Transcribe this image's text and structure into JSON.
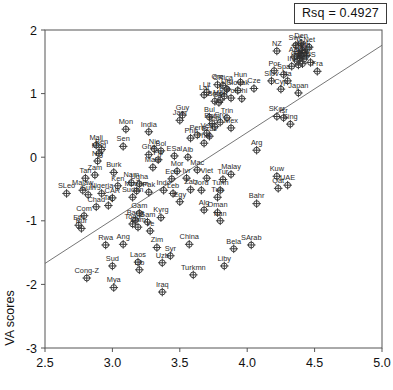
{
  "annotation": {
    "rsq_label": "Rsq = 0.4927"
  },
  "chart_data": {
    "type": "scatter",
    "title": "",
    "xlabel": "",
    "ylabel": "VA scores",
    "xlim": [
      2.5,
      5.0
    ],
    "ylim": [
      -3,
      2
    ],
    "xticks": [
      "2.5",
      "3.0",
      "3.5",
      "4.0",
      "4.5",
      "5.0"
    ],
    "xtick_values": [
      2.5,
      3.0,
      3.5,
      4.0,
      4.5,
      5.0
    ],
    "yticks": [
      "2",
      "1",
      "0",
      "-1",
      "-2",
      "-3"
    ],
    "ytick_values": [
      2,
      1,
      0,
      -1,
      -2,
      -3
    ],
    "grid": false,
    "legend": "none",
    "marker": "circle-with-cross",
    "rsq": 0.4927,
    "trendline": {
      "type": "linear",
      "x0": 2.5,
      "y0": -1.67,
      "x1": 5.0,
      "y1": 1.76
    },
    "points": [
      {
        "label": "Den",
        "x": 4.4,
        "y": 1.79
      },
      {
        "label": "Swe",
        "x": 4.36,
        "y": 1.76
      },
      {
        "label": "Net",
        "x": 4.46,
        "y": 1.73
      },
      {
        "label": "NZ",
        "x": 4.22,
        "y": 1.67
      },
      {
        "label": "Nor",
        "x": 4.41,
        "y": 1.68
      },
      {
        "label": "Fin",
        "x": 4.43,
        "y": 1.65
      },
      {
        "label": "Swi",
        "x": 4.38,
        "y": 1.63
      },
      {
        "label": "Can",
        "x": 4.4,
        "y": 1.62
      },
      {
        "label": "Lux",
        "x": 4.44,
        "y": 1.6
      },
      {
        "label": "Aut",
        "x": 4.35,
        "y": 1.58
      },
      {
        "label": "Aus",
        "x": 4.39,
        "y": 1.56
      },
      {
        "label": "Ice",
        "x": 4.42,
        "y": 1.54
      },
      {
        "label": "Ger",
        "x": 4.37,
        "y": 1.51
      },
      {
        "label": "US",
        "x": 4.47,
        "y": 1.49
      },
      {
        "label": "Bel",
        "x": 4.41,
        "y": 1.47
      },
      {
        "label": "UK",
        "x": 4.38,
        "y": 1.45
      },
      {
        "label": "Ire",
        "x": 4.33,
        "y": 1.43
      },
      {
        "label": "Fra",
        "x": 4.52,
        "y": 1.35
      },
      {
        "label": "Por",
        "x": 4.2,
        "y": 1.36
      },
      {
        "label": "Spa",
        "x": 4.27,
        "y": 1.3
      },
      {
        "label": "Hun",
        "x": 3.95,
        "y": 1.18
      },
      {
        "label": "Slov",
        "x": 4.18,
        "y": 1.2
      },
      {
        "label": "Ita",
        "x": 4.3,
        "y": 1.2
      },
      {
        "label": "Gre",
        "x": 3.78,
        "y": 1.14
      },
      {
        "label": "CRica",
        "x": 3.82,
        "y": 1.13
      },
      {
        "label": "Cze",
        "x": 4.05,
        "y": 1.08
      },
      {
        "label": "Cyp",
        "x": 4.25,
        "y": 1.07
      },
      {
        "label": "Japan",
        "x": 4.38,
        "y": 1.01
      },
      {
        "label": "Slovak",
        "x": 3.93,
        "y": 1.05
      },
      {
        "label": "Uru",
        "x": 3.85,
        "y": 1.07
      },
      {
        "label": "Lit",
        "x": 3.7,
        "y": 1.02
      },
      {
        "label": "Lat",
        "x": 3.68,
        "y": 0.98
      },
      {
        "label": "Est",
        "x": 3.83,
        "y": 0.96
      },
      {
        "label": "Pol",
        "x": 3.88,
        "y": 0.93
      },
      {
        "label": "Chi",
        "x": 3.96,
        "y": 0.92
      },
      {
        "label": "Mau",
        "x": 3.8,
        "y": 0.9
      },
      {
        "label": "Bots",
        "x": 3.76,
        "y": 0.88
      },
      {
        "label": "SAf",
        "x": 3.79,
        "y": 0.86
      },
      {
        "label": "Guy",
        "x": 3.52,
        "y": 0.66
      },
      {
        "label": "Jam",
        "x": 3.5,
        "y": 0.58
      },
      {
        "label": "Bul",
        "x": 3.72,
        "y": 0.63
      },
      {
        "label": "Trin",
        "x": 3.85,
        "y": 0.62
      },
      {
        "label": "SKor",
        "x": 4.22,
        "y": 0.64
      },
      {
        "label": "Isr",
        "x": 4.27,
        "y": 0.62
      },
      {
        "label": "Sing",
        "x": 4.32,
        "y": 0.52
      },
      {
        "label": "Rom",
        "x": 3.74,
        "y": 0.53
      },
      {
        "label": "Cro",
        "x": 3.8,
        "y": 0.55
      },
      {
        "label": "Pan",
        "x": 3.76,
        "y": 0.48
      },
      {
        "label": "Mex",
        "x": 3.88,
        "y": 0.46
      },
      {
        "label": "Mon",
        "x": 3.1,
        "y": 0.44
      },
      {
        "label": "India",
        "x": 3.27,
        "y": 0.4
      },
      {
        "label": "Ven",
        "x": 3.7,
        "y": 0.38
      },
      {
        "label": "Peru",
        "x": 3.63,
        "y": 0.35
      },
      {
        "label": "Braz",
        "x": 3.72,
        "y": 0.33
      },
      {
        "label": "Phil",
        "x": 3.58,
        "y": 0.3
      },
      {
        "label": "Sen",
        "x": 3.08,
        "y": 0.17
      },
      {
        "label": "Mali",
        "x": 2.88,
        "y": 0.19
      },
      {
        "label": "Ben",
        "x": 2.92,
        "y": 0.12
      },
      {
        "label": "Mad",
        "x": 2.9,
        "y": 0.06
      },
      {
        "label": "Nic",
        "x": 3.31,
        "y": 0.13
      },
      {
        "label": "Bol",
        "x": 3.36,
        "y": 0.1
      },
      {
        "label": "Gha",
        "x": 3.27,
        "y": 0.04
      },
      {
        "label": "Arg",
        "x": 4.07,
        "y": 0.11
      },
      {
        "label": "Thai",
        "x": 3.68,
        "y": 0.22
      },
      {
        "label": "ESal",
        "x": 3.46,
        "y": 0.02
      },
      {
        "label": "Alb",
        "x": 3.56,
        "y": 0.0
      },
      {
        "label": "Nig",
        "x": 2.89,
        "y": -0.06
      },
      {
        "label": "Fiji",
        "x": 3.34,
        "y": -0.04
      },
      {
        "label": "Burk",
        "x": 3.01,
        "y": -0.24
      },
      {
        "label": "Mala",
        "x": 3.3,
        "y": -0.16
      },
      {
        "label": "Mor",
        "x": 3.48,
        "y": -0.22
      },
      {
        "label": "Mac",
        "x": 3.63,
        "y": -0.2
      },
      {
        "label": "Malay",
        "x": 3.88,
        "y": -0.27
      },
      {
        "label": "Kuw",
        "x": 4.22,
        "y": -0.3
      },
      {
        "label": "Tan",
        "x": 2.8,
        "y": -0.33
      },
      {
        "label": "Zam",
        "x": 2.87,
        "y": -0.28
      },
      {
        "label": "Nam",
        "x": 3.14,
        "y": -0.4
      },
      {
        "label": "Ugha",
        "x": 3.2,
        "y": -0.42
      },
      {
        "label": "Ecu",
        "x": 3.44,
        "y": -0.34
      },
      {
        "label": "Ivr",
        "x": 3.55,
        "y": -0.33
      },
      {
        "label": "Ken",
        "x": 3.04,
        "y": -0.45
      },
      {
        "label": "Viet",
        "x": 3.7,
        "y": -0.33
      },
      {
        "label": "Tur",
        "x": 3.82,
        "y": -0.35
      },
      {
        "label": "SLeo",
        "x": 2.66,
        "y": -0.57
      },
      {
        "label": "Malaw",
        "x": 2.78,
        "y": -0.52
      },
      {
        "label": "Guin",
        "x": 2.82,
        "y": -0.59
      },
      {
        "label": "Nigeria",
        "x": 2.92,
        "y": -0.57
      },
      {
        "label": "Mozam",
        "x": 3.18,
        "y": -0.53
      },
      {
        "label": "Pak",
        "x": 3.27,
        "y": -0.55
      },
      {
        "label": "Indo",
        "x": 3.38,
        "y": -0.52
      },
      {
        "label": "Leb",
        "x": 3.45,
        "y": -0.57
      },
      {
        "label": "Qat",
        "x": 4.23,
        "y": -0.49
      },
      {
        "label": "UAE",
        "x": 4.3,
        "y": -0.44
      },
      {
        "label": "Zab",
        "x": 3.58,
        "y": -0.51
      },
      {
        "label": "Jord",
        "x": 3.66,
        "y": -0.52
      },
      {
        "label": "Tunh",
        "x": 3.8,
        "y": -0.52
      },
      {
        "label": "CAR",
        "x": 3.0,
        "y": -0.64
      },
      {
        "label": "Sudan",
        "x": 3.15,
        "y": -0.63
      },
      {
        "label": "Tun",
        "x": 3.78,
        "y": -0.63
      },
      {
        "label": "Bahr",
        "x": 4.07,
        "y": -0.73
      },
      {
        "label": "Egy",
        "x": 3.5,
        "y": -0.7
      },
      {
        "label": "Chad",
        "x": 2.88,
        "y": -0.78
      },
      {
        "label": "Taj",
        "x": 2.97,
        "y": -0.76
      },
      {
        "label": "Alg",
        "x": 3.68,
        "y": -0.83
      },
      {
        "label": "Oman",
        "x": 3.78,
        "y": -0.87
      },
      {
        "label": "Com",
        "x": 2.79,
        "y": -0.92
      },
      {
        "label": "Gam",
        "x": 3.2,
        "y": -0.88
      },
      {
        "label": "Kyrg",
        "x": 3.36,
        "y": -0.95
      },
      {
        "label": "Iran",
        "x": 3.8,
        "y": -1.0
      },
      {
        "label": "Bang",
        "x": 3.17,
        "y": -0.99
      },
      {
        "label": "Eth",
        "x": 2.75,
        "y": -1.07
      },
      {
        "label": "Bur",
        "x": 2.77,
        "y": -1.12
      },
      {
        "label": "Togo",
        "x": 3.15,
        "y": -1.05
      },
      {
        "label": "Gam2",
        "x": 3.26,
        "y": -1.02
      },
      {
        "label": "Cam",
        "x": 3.19,
        "y": -1.1
      },
      {
        "label": "Ye",
        "x": 3.28,
        "y": -1.16
      },
      {
        "label": "Rwa",
        "x": 2.95,
        "y": -1.38
      },
      {
        "label": "Ang",
        "x": 3.08,
        "y": -1.37
      },
      {
        "label": "Zim",
        "x": 3.33,
        "y": -1.42
      },
      {
        "label": "China",
        "x": 3.57,
        "y": -1.37
      },
      {
        "label": "Bela",
        "x": 3.9,
        "y": -1.44
      },
      {
        "label": "SArab",
        "x": 4.03,
        "y": -1.38
      },
      {
        "label": "Syr",
        "x": 3.43,
        "y": -1.55
      },
      {
        "label": "Uzb",
        "x": 3.37,
        "y": -1.66
      },
      {
        "label": "Sud",
        "x": 3.0,
        "y": -1.71
      },
      {
        "label": "Laos",
        "x": 3.19,
        "y": -1.65
      },
      {
        "label": "Liby",
        "x": 3.83,
        "y": -1.71
      },
      {
        "label": "Turkmn",
        "x": 3.6,
        "y": -1.85
      },
      {
        "label": "Cong-Z",
        "x": 2.81,
        "y": -1.9
      },
      {
        "label": "Lib",
        "x": 3.2,
        "y": -1.77
      },
      {
        "label": "Mya",
        "x": 3.01,
        "y": -2.05
      },
      {
        "label": "Iraq",
        "x": 3.37,
        "y": -2.12
      }
    ]
  }
}
